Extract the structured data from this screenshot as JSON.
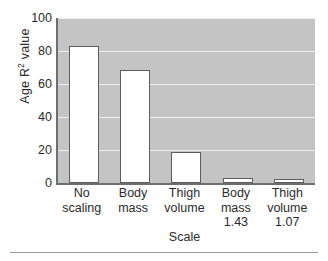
{
  "chart_data": {
    "type": "bar",
    "title": "",
    "xlabel": "Scale",
    "ylabel_prefix": "Age R",
    "ylabel_sup": "2",
    "ylabel_suffix": " value",
    "ylabel_plain": "Age R2 value",
    "categories": [
      "No scaling",
      "Body mass",
      "Thigh volume",
      "Body mass 1.43",
      "Thigh volume 1.07"
    ],
    "category_lines": [
      [
        "No",
        "scaling"
      ],
      [
        "Body",
        "mass"
      ],
      [
        "Thigh",
        "volume"
      ],
      [
        "Body",
        "mass",
        "1.43"
      ],
      [
        "Thigh",
        "volume",
        "1.07"
      ]
    ],
    "values": [
      83,
      68.5,
      19,
      3,
      2
    ],
    "ylim": [
      0,
      100
    ],
    "yticks": [
      100,
      80,
      60,
      40,
      20,
      0
    ],
    "ytick_labels": [
      "100",
      "80",
      "60",
      "40",
      "20",
      "0"
    ],
    "grid": true,
    "grid_axis": "y",
    "legend": "none",
    "colors": {
      "plot_background": "#c4c4c4",
      "gridline": "#efefef",
      "bar_fill": "#ffffff",
      "bar_edge": "#5d5d5d",
      "axis": "#6e6e6e",
      "text": "#2b2b2b",
      "page_background": "#ffffff"
    }
  }
}
